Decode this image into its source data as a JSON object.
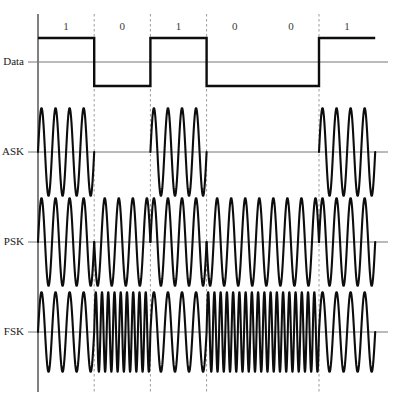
{
  "figure": {
    "bit_sequence": [
      1,
      0,
      1,
      0,
      0,
      1
    ],
    "bit_labels": [
      "1",
      "0",
      "1",
      "0",
      "0",
      "1"
    ],
    "axis_label": "t",
    "colors": {
      "wave": "#0d0d0d",
      "baseline": "#777777",
      "vertical_axis": "#808080",
      "gridline": "#9a9a9a",
      "background": "#ffffff"
    },
    "rows": [
      {
        "label": "Data",
        "name": "data"
      },
      {
        "label": "ASK",
        "name": "ask"
      },
      {
        "label": "PSK",
        "name": "psk"
      },
      {
        "label": "FSK",
        "name": "fsk"
      }
    ]
  },
  "chart_data": {
    "type": "line",
    "xlabel": "t",
    "ylabel": "",
    "grid": true,
    "legend": null,
    "bit_sequence": [
      1,
      0,
      1,
      0,
      0,
      1
    ],
    "bit_labels": [
      "1",
      "0",
      "1",
      "0",
      "0",
      "1"
    ],
    "bit_count": 6,
    "plot_x_start": 38,
    "plot_x_end": 375,
    "bit_width": 56.2,
    "bit_boundaries_px": [
      38,
      94.2,
      150.4,
      206.6,
      262.8,
      319.0,
      375.2
    ],
    "gridlines_px": [
      94.2,
      150.4,
      206.6,
      319.0
    ],
    "series": [
      {
        "name": "Data",
        "type": "square",
        "high_level": 1,
        "low_level": -1,
        "values": [
          1,
          0,
          1,
          0,
          0,
          1
        ],
        "baseline_y": 62,
        "amplitude_px": 24
      },
      {
        "name": "ASK",
        "type": "amplitude-shift-keying",
        "carrier_cycles_per_bit": 4,
        "amplitude_for_one": 1,
        "amplitude_for_zero": 0,
        "values": [
          1,
          0,
          1,
          0,
          0,
          1
        ],
        "baseline_y": 152,
        "amplitude_px": 44
      },
      {
        "name": "PSK",
        "type": "phase-shift-keying",
        "carrier_cycles_per_bit": 4,
        "phase_for_one_deg": 0,
        "phase_for_zero_deg": 180,
        "values": [
          1,
          0,
          1,
          0,
          0,
          1
        ],
        "baseline_y": 242,
        "amplitude_px": 44
      },
      {
        "name": "FSK",
        "type": "frequency-shift-keying",
        "cycles_per_bit_for_one": 4,
        "cycles_per_bit_for_zero": 9,
        "values": [
          1,
          0,
          1,
          0,
          0,
          1
        ],
        "baseline_y": 332,
        "amplitude_px": 40
      }
    ]
  }
}
